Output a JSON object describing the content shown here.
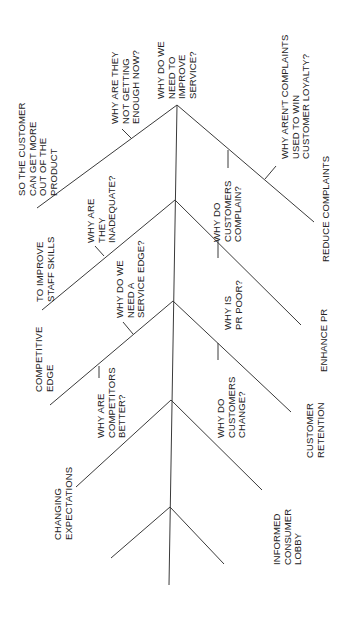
{
  "diagram": {
    "type": "why-why tree (rotated 90°)",
    "root": "WHY DO WE NEED TO IMPROVE SERVICE?",
    "labels": {
      "root_question": "WHY DO WE\nNEED TO\nIMPROVE\nSERVICE?",
      "q_not_enough": "WHY ARE THEY\nNOT GETTING\nENOUGH NOW?",
      "a_get_more": "SO THE CUSTOMER\nCAN GET MORE\nOUT OF THE\nPRODUCT",
      "q_complaints_loyalty": "WHY AREN'T COMPLAINTS\nUSED TO WIN\nCUSTOMER LOYALTY?",
      "a_reduce_complaints": "REDUCE COMPLAINTS",
      "q_customers_complain": "WHY DO\nCUSTOMERS\nCOMPLAIN?",
      "q_inadequate": "WHY ARE\nTHEY\nINADEQUATE?",
      "a_staff_skills": "TO IMPROVE\nSTAFF SKILLS",
      "q_pr_poor": "WHY IS\nPR POOR?",
      "a_enhance_pr": "ENHANCE PR",
      "q_service_edge": "WHY DO WE\nNEED A\nSERVICE EDGE?",
      "a_competitive_edge": "COMPETITIVE\nEDGE",
      "q_competitors_better": "WHY ARE\nCOMPETITORS\nBETTER?",
      "q_customers_change": "WHY DO\nCUSTOMERS\nCHANGE?",
      "a_customer_retention": "CUSTOMER\nRETENTION",
      "a_changing_expectations": "CHANGING\nEXPECTATIONS",
      "a_informed_lobby": "INFORMED\nCONSUMER\nLOBBY"
    },
    "line_color": "#3a3a3a",
    "text_color": "#222222",
    "background": "#ffffff"
  }
}
